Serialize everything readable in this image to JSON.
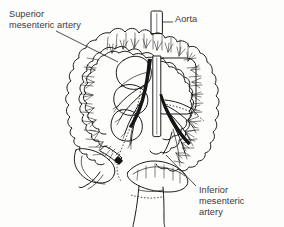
{
  "figure": {
    "kind": "anatomical-line-drawing",
    "background_color": "#fdfdfc",
    "ink_color": "#1b1b1b",
    "text_color": "#3a3a3a",
    "labels": [
      {
        "id": "superior-mesenteric-artery",
        "text": "Superior\nmesenteric artery",
        "line1": "Superior",
        "line2": "mesenteric artery",
        "position": "top-left",
        "has_leader_line": true
      },
      {
        "id": "aorta",
        "text": "Aorta",
        "line1": "Aorta",
        "position": "top-right",
        "has_leader_line": true
      },
      {
        "id": "inferior-mesenteric-artery",
        "text": "Inferior\nmesenteric\nartery",
        "line1": "Inferior",
        "line2": "mesenteric",
        "line3": "artery",
        "position": "bottom-right",
        "has_leader_line": true
      }
    ],
    "structures": [
      "aorta-stump",
      "transverse-colon",
      "ascending-colon",
      "descending-colon",
      "cecum",
      "appendix",
      "sigmoid-colon",
      "rectum",
      "small-bowel-mesentery",
      "superior-mesenteric-artery-trunk",
      "inferior-mesenteric-artery-trunk",
      "marginal-artery",
      "vasa-recta"
    ]
  }
}
